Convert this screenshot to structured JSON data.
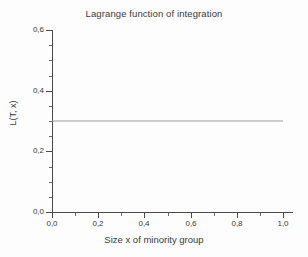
{
  "chart_data": {
    "type": "line",
    "title": "Lagrange function of integration",
    "xlabel": "Size x of minority group",
    "ylabel": "L(T, x)",
    "xlim": [
      0.0,
      1.0
    ],
    "ylim": [
      0.0,
      0.6
    ],
    "grid": false,
    "legend": null,
    "x_tick_labels": [
      "0,0",
      "0,2",
      "0,4",
      "0,6",
      "0,8",
      "1,0"
    ],
    "x_tick_values": [
      0.0,
      0.2,
      0.4,
      0.6,
      0.8,
      1.0
    ],
    "x_minor_tick_values": [
      0.1,
      0.3,
      0.5,
      0.7,
      0.9
    ],
    "y_tick_labels": [
      "0,0",
      "0,2",
      "0,4",
      "0,6"
    ],
    "y_tick_values": [
      0.0,
      0.2,
      0.4,
      0.6
    ],
    "y_minor_tick_values": [
      0.05,
      0.1,
      0.15,
      0.25,
      0.3,
      0.35,
      0.45,
      0.5,
      0.55
    ],
    "series": [
      {
        "name": "L(T, x)",
        "color": "#9a9a9a",
        "x": [
          0.0,
          0.1,
          0.2,
          0.3,
          0.4,
          0.5,
          0.6,
          0.7,
          0.8,
          0.9,
          1.0
        ],
        "values": [
          0.3,
          0.3,
          0.3,
          0.3,
          0.3,
          0.3,
          0.3,
          0.3,
          0.3,
          0.3,
          0.3
        ]
      }
    ]
  },
  "colors": {
    "background": "#fdfdfd",
    "axis": "#4a4a4a",
    "text": "#3a3a3a",
    "series": "#9a9a9a"
  }
}
